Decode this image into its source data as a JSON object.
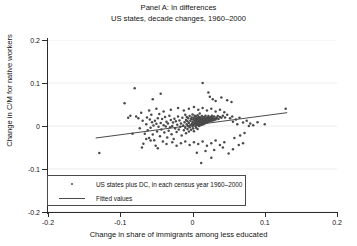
{
  "chart_data": {
    "type": "scatter",
    "title": "Panel A: In differences",
    "subtitle": "US states, decade changes, 1960–2000",
    "xlabel": "Change in share of immigrants among less educated",
    "ylabel": "Change in C/M for native workers",
    "xlim": [
      -0.2,
      0.2
    ],
    "ylim": [
      -0.2,
      0.2
    ],
    "xticks": [
      -0.2,
      -0.1,
      0,
      0.1,
      0.2
    ],
    "yticks": [
      -0.2,
      -0.1,
      0,
      0.1,
      0.2
    ],
    "xticklabels": [
      "-0.2",
      "-0.1",
      "0",
      "0.1",
      "0.2"
    ],
    "yticklabels": [
      "-0.2",
      "-0.1",
      "0",
      "0.1",
      "0.2"
    ],
    "grid": "horizontal-faint",
    "legend_position": "lower-left",
    "legend": [
      {
        "marker": "dot",
        "label": "US states plus DC, in each census year 1960–2000"
      },
      {
        "marker": "line",
        "label": "Fitted values"
      }
    ],
    "series": [
      {
        "name": "US states plus DC, in each census year 1960–2000",
        "type": "scatter",
        "points": [
          [
            -0.129,
            -0.063
          ],
          [
            -0.094,
            0.053
          ],
          [
            -0.089,
            0.019
          ],
          [
            -0.086,
            0.024
          ],
          [
            -0.083,
            -0.018
          ],
          [
            -0.08,
            0.088
          ],
          [
            -0.078,
            0.022
          ],
          [
            -0.075,
            0.018
          ],
          [
            -0.073,
            -0.005
          ],
          [
            -0.071,
            0.031
          ],
          [
            -0.069,
            0.012
          ],
          [
            -0.068,
            -0.041
          ],
          [
            -0.066,
            -0.018
          ],
          [
            -0.064,
            0.004
          ],
          [
            -0.063,
            0.02
          ],
          [
            -0.062,
            -0.01
          ],
          [
            -0.06,
            -0.028
          ],
          [
            -0.059,
            0.015
          ],
          [
            -0.058,
            -0.004
          ],
          [
            -0.057,
            0.026
          ],
          [
            -0.056,
            0.009
          ],
          [
            -0.055,
            -0.02
          ],
          [
            -0.054,
            0.001
          ],
          [
            -0.053,
            -0.033
          ],
          [
            -0.052,
            0.012
          ],
          [
            -0.051,
            -0.046
          ],
          [
            -0.05,
            0.005
          ],
          [
            -0.049,
            -0.013
          ],
          [
            -0.048,
            0.018
          ],
          [
            -0.047,
            -0.002
          ],
          [
            -0.046,
            0.028
          ],
          [
            -0.045,
            -0.024
          ],
          [
            -0.044,
            0.007
          ],
          [
            -0.043,
            -0.008
          ],
          [
            -0.042,
            0.016
          ],
          [
            -0.041,
            -0.036
          ],
          [
            -0.04,
            0.002
          ],
          [
            -0.039,
            -0.015
          ],
          [
            -0.038,
            0.021
          ],
          [
            -0.037,
            -0.001
          ],
          [
            -0.036,
            0.01
          ],
          [
            -0.035,
            -0.027
          ],
          [
            -0.034,
            0.006
          ],
          [
            -0.033,
            -0.011
          ],
          [
            -0.032,
            0.024
          ],
          [
            -0.031,
            -0.003
          ],
          [
            -0.03,
            0.014
          ],
          [
            -0.029,
            -0.019
          ],
          [
            -0.028,
            0.0
          ],
          [
            -0.027,
            0.008
          ],
          [
            -0.026,
            -0.03
          ],
          [
            -0.025,
            0.017
          ],
          [
            -0.024,
            -0.006
          ],
          [
            -0.023,
            0.011
          ],
          [
            -0.022,
            -0.014
          ],
          [
            -0.021,
            0.003
          ],
          [
            -0.02,
            0.022
          ],
          [
            -0.019,
            -0.008
          ],
          [
            -0.018,
            0.013
          ],
          [
            -0.017,
            -0.002
          ],
          [
            -0.016,
            0.006
          ],
          [
            -0.015,
            -0.022
          ],
          [
            -0.014,
            0.019
          ],
          [
            -0.013,
            0.001
          ],
          [
            -0.012,
            -0.01
          ],
          [
            -0.011,
            0.009
          ],
          [
            -0.01,
            0.026
          ],
          [
            -0.01,
            -0.004
          ],
          [
            -0.009,
            0.014
          ],
          [
            -0.009,
            -0.017
          ],
          [
            -0.008,
            0.004
          ],
          [
            -0.008,
            0.021
          ],
          [
            -0.007,
            -0.007
          ],
          [
            -0.007,
            0.011
          ],
          [
            -0.006,
            0.0
          ],
          [
            -0.006,
            0.018
          ],
          [
            -0.005,
            -0.013
          ],
          [
            -0.005,
            0.007
          ],
          [
            -0.004,
            0.023
          ],
          [
            -0.004,
            -0.003
          ],
          [
            -0.003,
            0.012
          ],
          [
            -0.003,
            0.002
          ],
          [
            -0.002,
            -0.009
          ],
          [
            -0.002,
            0.016
          ],
          [
            -0.001,
            0.005
          ],
          [
            -0.001,
            0.02
          ],
          [
            0.0,
            -0.001
          ],
          [
            0.0,
            0.01
          ],
          [
            0.0,
            0.027
          ],
          [
            0.001,
            0.003
          ],
          [
            0.001,
            0.015
          ],
          [
            0.001,
            -0.006
          ],
          [
            0.002,
            0.008
          ],
          [
            0.002,
            0.019
          ],
          [
            0.002,
            -0.012
          ],
          [
            0.003,
            0.005
          ],
          [
            0.003,
            0.013
          ],
          [
            0.003,
            0.024
          ],
          [
            0.004,
            0.0
          ],
          [
            0.004,
            0.009
          ],
          [
            0.004,
            0.017
          ],
          [
            0.005,
            -0.004
          ],
          [
            0.005,
            0.006
          ],
          [
            0.005,
            0.014
          ],
          [
            0.005,
            0.022
          ],
          [
            0.006,
            0.002
          ],
          [
            0.006,
            0.011
          ],
          [
            0.006,
            0.019
          ],
          [
            0.007,
            -0.007
          ],
          [
            0.007,
            0.007
          ],
          [
            0.007,
            0.015
          ],
          [
            0.007,
            0.025
          ],
          [
            0.008,
            0.003
          ],
          [
            0.008,
            0.01
          ],
          [
            0.008,
            0.018
          ],
          [
            0.009,
            0.0
          ],
          [
            0.009,
            0.008
          ],
          [
            0.009,
            0.013
          ],
          [
            0.009,
            0.021
          ],
          [
            0.01,
            0.005
          ],
          [
            0.01,
            0.011
          ],
          [
            0.01,
            0.016
          ],
          [
            0.01,
            0.029
          ],
          [
            0.011,
            0.002
          ],
          [
            0.011,
            0.009
          ],
          [
            0.011,
            0.014
          ],
          [
            0.011,
            0.02
          ],
          [
            0.012,
            0.006
          ],
          [
            0.012,
            0.012
          ],
          [
            0.012,
            0.017
          ],
          [
            0.013,
            0.003
          ],
          [
            0.013,
            0.01
          ],
          [
            0.013,
            0.015
          ],
          [
            0.013,
            0.023
          ],
          [
            0.014,
            0.007
          ],
          [
            0.014,
            0.012
          ],
          [
            0.014,
            0.018
          ],
          [
            0.015,
            0.004
          ],
          [
            0.015,
            0.01
          ],
          [
            0.015,
            0.016
          ],
          [
            0.016,
            0.008
          ],
          [
            0.016,
            0.013
          ],
          [
            0.016,
            0.021
          ],
          [
            0.017,
            0.006
          ],
          [
            0.017,
            0.012
          ],
          [
            0.017,
            0.018
          ],
          [
            0.018,
            0.009
          ],
          [
            0.018,
            0.015
          ],
          [
            0.018,
            0.024
          ],
          [
            0.019,
            0.011
          ],
          [
            0.019,
            0.017
          ],
          [
            0.02,
            0.008
          ],
          [
            0.02,
            0.014
          ],
          [
            0.02,
            0.02
          ],
          [
            0.021,
            0.012
          ],
          [
            0.021,
            0.018
          ],
          [
            0.022,
            0.01
          ],
          [
            0.022,
            0.016
          ],
          [
            0.022,
            0.023
          ],
          [
            0.023,
            0.013
          ],
          [
            0.023,
            0.019
          ],
          [
            0.024,
            0.011
          ],
          [
            0.024,
            0.017
          ],
          [
            0.025,
            0.014
          ],
          [
            0.025,
            0.021
          ],
          [
            0.026,
            0.012
          ],
          [
            0.026,
            0.018
          ],
          [
            0.027,
            0.015
          ],
          [
            0.027,
            0.024
          ],
          [
            0.028,
            0.013
          ],
          [
            0.028,
            0.019
          ],
          [
            0.029,
            0.016
          ],
          [
            0.03,
            0.014
          ],
          [
            0.03,
            0.022
          ],
          [
            0.031,
            0.017
          ],
          [
            0.032,
            0.015
          ],
          [
            0.033,
            0.02
          ],
          [
            0.034,
            0.018
          ],
          [
            0.035,
            0.023
          ],
          [
            0.036,
            0.016
          ],
          [
            0.038,
            0.021
          ],
          [
            0.04,
            0.019
          ],
          [
            0.042,
            0.024
          ],
          [
            0.045,
            0.02
          ],
          [
            0.048,
            0.026
          ],
          [
            0.052,
            0.018
          ],
          [
            0.055,
            0.022
          ],
          [
            0.06,
            0.015
          ],
          [
            0.065,
            0.019
          ],
          [
            0.07,
            0.008
          ],
          [
            0.075,
            0.012
          ],
          [
            0.08,
            0.006
          ],
          [
            0.09,
            0.009
          ],
          [
            0.1,
            0.004
          ],
          [
            0.129,
            0.04
          ],
          [
            -0.06,
            0.036
          ],
          [
            -0.05,
            0.04
          ],
          [
            -0.04,
            0.034
          ],
          [
            -0.03,
            0.038
          ],
          [
            -0.02,
            0.042
          ],
          [
            -0.012,
            0.036
          ],
          [
            -0.005,
            0.04
          ],
          [
            0.002,
            0.044
          ],
          [
            0.008,
            0.038
          ],
          [
            0.014,
            0.042
          ],
          [
            0.02,
            0.036
          ],
          [
            0.026,
            0.04
          ],
          [
            0.032,
            0.034
          ],
          [
            0.038,
            0.038
          ],
          [
            0.044,
            0.032
          ],
          [
            -0.055,
            0.062
          ],
          [
            -0.044,
            0.075
          ],
          [
            0.014,
            0.1
          ],
          [
            0.022,
            0.078
          ],
          [
            0.024,
            0.068
          ],
          [
            0.028,
            0.062
          ],
          [
            0.032,
            0.058
          ],
          [
            0.04,
            0.066
          ],
          [
            0.048,
            0.06
          ],
          [
            0.054,
            0.056
          ],
          [
            -0.048,
            -0.052
          ],
          [
            -0.036,
            -0.042
          ],
          [
            -0.028,
            -0.038
          ],
          [
            -0.022,
            -0.046
          ],
          [
            -0.016,
            -0.04
          ],
          [
            -0.01,
            -0.036
          ],
          [
            -0.004,
            -0.044
          ],
          [
            0.002,
            -0.038
          ],
          [
            0.008,
            -0.042
          ],
          [
            0.014,
            -0.036
          ],
          [
            0.02,
            -0.046
          ],
          [
            0.026,
            -0.04
          ],
          [
            0.032,
            -0.034
          ],
          [
            0.038,
            -0.044
          ],
          [
            0.044,
            -0.038
          ],
          [
            0.006,
            -0.062
          ],
          [
            0.018,
            -0.058
          ],
          [
            0.03,
            -0.056
          ],
          [
            0.042,
            -0.05
          ],
          [
            0.056,
            -0.054
          ],
          [
            0.064,
            -0.044
          ],
          [
            0.07,
            -0.04
          ],
          [
            0.012,
            -0.086
          ],
          [
            0.026,
            -0.074
          ],
          [
            0.05,
            -0.064
          ],
          [
            -0.07,
            -0.05
          ],
          [
            -0.064,
            -0.03
          ],
          [
            -0.058,
            -0.034
          ],
          [
            0.058,
            -0.028
          ],
          [
            0.066,
            -0.022
          ],
          [
            0.072,
            -0.016
          ],
          [
            0.078,
            0.0
          ],
          [
            0.084,
            0.002
          ],
          [
            0.062,
            0.004
          ],
          [
            0.056,
            0.01
          ]
        ]
      },
      {
        "name": "Fitted values",
        "type": "line",
        "x": [
          -0.134,
          0.131
        ],
        "y": [
          -0.028,
          0.031
        ]
      }
    ]
  }
}
